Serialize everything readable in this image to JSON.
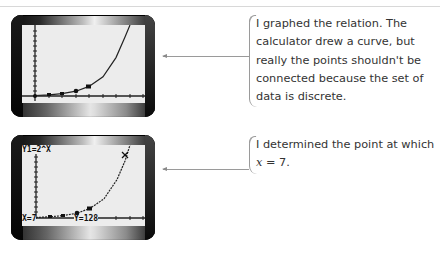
{
  "figure": {
    "panels": [
      {
        "screen": {
          "equation_label": "",
          "cursor_x_label": "",
          "cursor_y_label": "",
          "function": "y = 2^x",
          "points_marked": [
            [
              0,
              1
            ],
            [
              1,
              2
            ],
            [
              2,
              4
            ],
            [
              3,
              8
            ],
            [
              4,
              16
            ]
          ]
        },
        "callout": {
          "text": "I graphed the relation. The calculator drew a curve, but really the points shouldn't be connected because the set of data is discrete."
        }
      },
      {
        "screen": {
          "equation_label": "Y1=2^X",
          "cursor_x_label": "X=7",
          "cursor_y_label": "Y=128",
          "function": "y = 2^x",
          "trace_point": [
            7,
            128
          ]
        },
        "callout": {
          "text_before": "I determined the point at which ",
          "variable": "x",
          "text_after": " = 7."
        }
      }
    ],
    "colors": {
      "screen_bg": "#ececec",
      "curve": "#222222",
      "callout_text": "#333333",
      "leader_line": "#9a9a9a"
    }
  }
}
